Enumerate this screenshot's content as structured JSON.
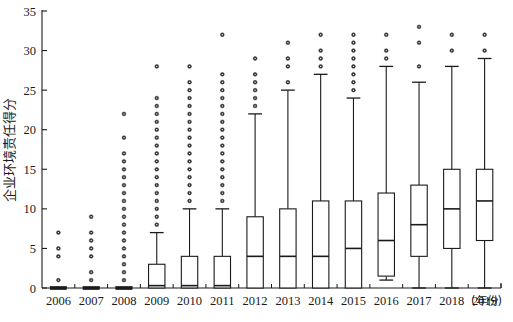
{
  "chart_data": {
    "type": "box",
    "title": "",
    "xlabel": "年份",
    "ylabel": "企业环境责任得分",
    "ylim": [
      0,
      35
    ],
    "yticks": [
      0,
      5,
      10,
      15,
      20,
      25,
      30,
      35
    ],
    "ytick_labels": [
      "0",
      "5",
      "10",
      "15",
      "20",
      "25",
      "30",
      "35"
    ],
    "categories": [
      "2006",
      "2007",
      "2008",
      "2009",
      "2010",
      "2011",
      "2012",
      "2013",
      "2014",
      "2015",
      "2016",
      "2017",
      "2018",
      "2019"
    ],
    "grid": false,
    "legend": null,
    "axis_color": "#1a1a1a",
    "box_color": "#1a1a1a",
    "box_fill": "#ffffff",
    "outlier_color": "#333333",
    "boxes": [
      {
        "year": "2006",
        "whisker_low": 0,
        "q1": 0,
        "median": 0,
        "q3": 0,
        "whisker_high": 0,
        "outliers": [
          1,
          4,
          5,
          7
        ]
      },
      {
        "year": "2007",
        "whisker_low": 0,
        "q1": 0,
        "median": 0,
        "q3": 0,
        "whisker_high": 0,
        "outliers": [
          1,
          2,
          4,
          5,
          6,
          7,
          9
        ]
      },
      {
        "year": "2008",
        "whisker_low": 0,
        "q1": 0,
        "median": 0,
        "q3": 0,
        "whisker_high": 0,
        "outliers": [
          1,
          2,
          3,
          4,
          5,
          6,
          7,
          8,
          9,
          10,
          11,
          12,
          13,
          14,
          15,
          16,
          17,
          19,
          22
        ]
      },
      {
        "year": "2009",
        "whisker_low": 0,
        "q1": 0,
        "median": 0.3,
        "q3": 3,
        "whisker_high": 7,
        "outliers": [
          8,
          9,
          10,
          11,
          12,
          13,
          14,
          15,
          16,
          17,
          18,
          19,
          20,
          21,
          22,
          23,
          24,
          28
        ]
      },
      {
        "year": "2010",
        "whisker_low": 0,
        "q1": 0,
        "median": 0.3,
        "q3": 4,
        "whisker_high": 10,
        "outliers": [
          11,
          12,
          13,
          14,
          15,
          16,
          17,
          18,
          19,
          20,
          21,
          22,
          23,
          24,
          25,
          26,
          28
        ]
      },
      {
        "year": "2011",
        "whisker_low": 0,
        "q1": 0,
        "median": 0.3,
        "q3": 4,
        "whisker_high": 10,
        "outliers": [
          11,
          12,
          13,
          14,
          15,
          16,
          17,
          18,
          19,
          20,
          21,
          22,
          23,
          24,
          25,
          26,
          27,
          32
        ]
      },
      {
        "year": "2012",
        "whisker_low": 0,
        "q1": 0,
        "median": 4,
        "q3": 9,
        "whisker_high": 22,
        "outliers": [
          23,
          24,
          25,
          26,
          27,
          29
        ]
      },
      {
        "year": "2013",
        "whisker_low": 0,
        "q1": 0,
        "median": 4,
        "q3": 10,
        "whisker_high": 25,
        "outliers": [
          26,
          28,
          29,
          31
        ]
      },
      {
        "year": "2014",
        "whisker_low": 0,
        "q1": 0,
        "median": 4,
        "q3": 11,
        "whisker_high": 27,
        "outliers": [
          28,
          29,
          30,
          32
        ]
      },
      {
        "year": "2015",
        "whisker_low": 0,
        "q1": 0,
        "median": 5,
        "q3": 11,
        "whisker_high": 24,
        "outliers": [
          25,
          26,
          27,
          28,
          29,
          30,
          31,
          32
        ]
      },
      {
        "year": "2016",
        "whisker_low": 1,
        "q1": 1.5,
        "median": 6,
        "q3": 12,
        "whisker_high": 28,
        "outliers": [
          29,
          30,
          32
        ]
      },
      {
        "year": "2017",
        "whisker_low": 0,
        "q1": 4,
        "median": 8,
        "q3": 13,
        "whisker_high": 26,
        "outliers": [
          28,
          31,
          33
        ]
      },
      {
        "year": "2018",
        "whisker_low": 0,
        "q1": 5,
        "median": 10,
        "q3": 15,
        "whisker_high": 28,
        "outliers": [
          30,
          32
        ]
      },
      {
        "year": "2019",
        "whisker_low": 0,
        "q1": 6,
        "median": 11,
        "q3": 15,
        "whisker_high": 29,
        "outliers": [
          30,
          32
        ]
      }
    ]
  }
}
